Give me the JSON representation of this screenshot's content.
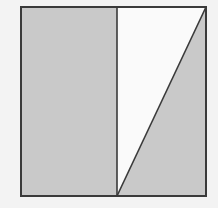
{
  "diagram": {
    "colors": {
      "background": "#f3f3f3",
      "shaded": "#c9c9c9",
      "unshaded": "#fafafa",
      "stroke": "#3a3a3a"
    },
    "square": {
      "x": 21,
      "y": 7,
      "width": 185,
      "height": 189
    },
    "divider_x": 117,
    "regions": [
      {
        "name": "left-rectangle",
        "shaded": true
      },
      {
        "name": "upper-left-triangle-right-half",
        "shaded": false
      },
      {
        "name": "lower-right-triangle-right-half",
        "shaded": true
      }
    ]
  }
}
